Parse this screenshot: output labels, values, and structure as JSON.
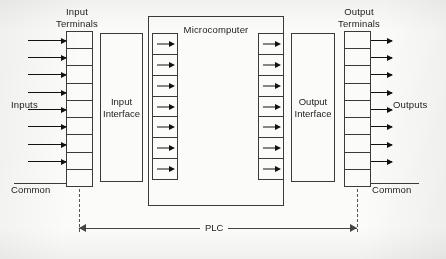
{
  "diagram": {
    "headers": {
      "input_terminals_line1": "Input",
      "input_terminals_line2": "Terminals",
      "output_terminals_line1": "Output",
      "output_terminals_line2": "Terminals"
    },
    "blocks": {
      "input_interface_line1": "Input",
      "input_interface_line2": "Interface",
      "microcomputer": "Microcomputer",
      "output_interface_line1": "Output",
      "output_interface_line2": "Interface"
    },
    "side_labels": {
      "inputs": "Inputs",
      "outputs": "Outputs",
      "common_left": "Common",
      "common_right": "Common"
    },
    "dimension": {
      "label": "PLC"
    },
    "counts": {
      "input_terminal_cells": 9,
      "input_signal_arrows": 8,
      "micro_left_cells": 7,
      "micro_right_cells": 7,
      "output_terminal_cells": 9,
      "output_signal_arrows": 8
    },
    "colors": {
      "ink": "#232323",
      "line": "#3a3a3a",
      "arrow": "#111111",
      "paper": "#fbfbf9",
      "leader": "#555555"
    }
  }
}
